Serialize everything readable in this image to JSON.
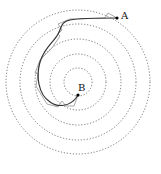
{
  "diagram": {
    "type": "spiral-path-over-concentric-circles",
    "center": [
      78,
      82
    ],
    "circle_radii": [
      14,
      28,
      43,
      58,
      72
    ],
    "circle_style": "dotted",
    "points": {
      "A": {
        "label": "A",
        "x": 117,
        "y": 18
      },
      "B": {
        "label": "B",
        "x": 78,
        "y": 95
      }
    },
    "paths": [
      {
        "name": "smooth-path",
        "color": "#333333"
      },
      {
        "name": "polygonal-path",
        "color": "#aaaaaa"
      }
    ]
  }
}
